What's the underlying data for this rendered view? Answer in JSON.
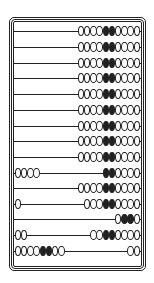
{
  "abacus": {
    "description": "Abacus with 15 rods, 10 beads per rod (4 white, 2 black, 4 white)",
    "colors": {
      "frame": "#222222",
      "bead_light": "#ffffff",
      "bead_dark": "#222222",
      "background": "#ffffff"
    },
    "rows": [
      {
        "y": 26,
        "left": "",
        "right": "WWWWBBWWWW"
      },
      {
        "y": 42,
        "left": "",
        "right": "WWWWBBWWWW"
      },
      {
        "y": 58,
        "left": "",
        "right": "WWWWBBWWWW"
      },
      {
        "y": 73,
        "left": "",
        "right": "WWWWBBWWWW"
      },
      {
        "y": 89,
        "left": "",
        "right": "WWWWBBWWWW"
      },
      {
        "y": 105,
        "left": "",
        "right": "WWWWBBWWWW"
      },
      {
        "y": 121,
        "left": "",
        "right": "WWWWBBWWWW"
      },
      {
        "y": 136,
        "left": "",
        "right": "WWWWBBWWWW"
      },
      {
        "y": 152,
        "left": "",
        "right": "WWWWBBWWWW"
      },
      {
        "y": 168,
        "left": "WWWW",
        "right": "BBWWWW"
      },
      {
        "y": 183,
        "left": "",
        "right": "WWWWBBWWWW"
      },
      {
        "y": 199,
        "left": "W",
        "right": "WWWBBWWWW"
      },
      {
        "y": 214,
        "left": "",
        "right": "WBBW"
      },
      {
        "y": 230,
        "left": "WW",
        "right": "WWBBWWWW"
      },
      {
        "y": 246,
        "left": "WWWWBBWW",
        "right": "WW"
      }
    ]
  }
}
